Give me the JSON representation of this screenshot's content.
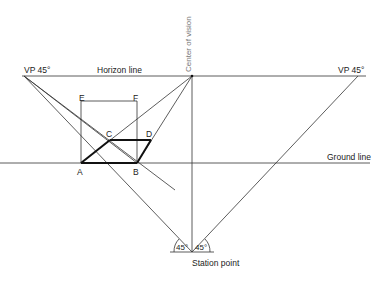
{
  "labels": {
    "vp_left": "VP 45°",
    "vp_right": "VP 45°",
    "horizon_line": "Horizon line",
    "center_of_vision": "Center of vision",
    "ground_line": "Ground line",
    "station_point": "Station point",
    "angle_left": "45°",
    "angle_right": "45°",
    "point_a": "A",
    "point_b": "B",
    "point_c": "C",
    "point_d": "D",
    "point_e": "E",
    "point_f": "F"
  },
  "colors": {
    "line": "#333333",
    "thick": "#111111"
  }
}
